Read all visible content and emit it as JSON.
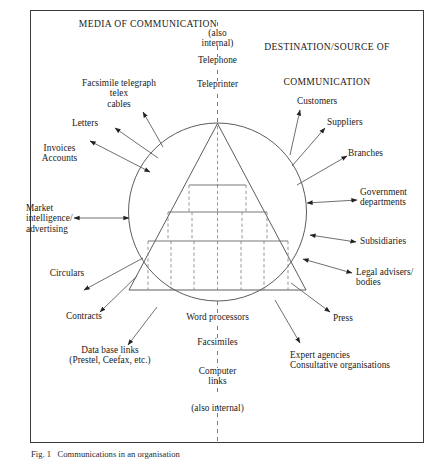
{
  "figure": {
    "caption": "Fig. 1   Communications in an organisation",
    "frame_color": "#3a3a3a",
    "line_color": "#4a4a4a",
    "text_color": "#1a1a1a"
  },
  "headings": {
    "left": "MEDIA OF COMMUNICATION",
    "right_line1": "DESTINATION/SOURCE OF",
    "right_line2": "COMMUNICATION"
  },
  "center_axis": {
    "top_items": [
      "(also\ninternal)",
      "Telephone",
      "Teleprinter"
    ],
    "bottom_items": [
      "Word processors",
      "Facsimiles",
      "Computer\nlinks",
      "(also internal)"
    ]
  },
  "media_labels": [
    {
      "text": "Facsimile telegraph\ntelex\ncables",
      "align": "center"
    },
    {
      "text": "Letters",
      "align": "center"
    },
    {
      "text": "Invoices\nAccounts",
      "align": "center"
    },
    {
      "text": "Market\nintelligence/\nadvertising",
      "align": "left"
    },
    {
      "text": "Circulars",
      "align": "center"
    },
    {
      "text": "Contracts",
      "align": "center"
    },
    {
      "text": "Data base links\n(Prestel, Ceefax, etc.)",
      "align": "center"
    }
  ],
  "destination_labels": [
    {
      "text": "Customers",
      "align": "left"
    },
    {
      "text": "Suppliers",
      "align": "left"
    },
    {
      "text": "Branches",
      "align": "left"
    },
    {
      "text": "Government\ndepartments",
      "align": "left"
    },
    {
      "text": "Subsidiaries",
      "align": "left"
    },
    {
      "text": "Legal advisers/\nbodies",
      "align": "left"
    },
    {
      "text": "Press",
      "align": "left"
    },
    {
      "text": "Expert agencies\nConsultative organisations",
      "align": "left"
    }
  ],
  "organisation": {
    "shape": "circle-with-pyramid",
    "description": "Organisation hierarchy pyramid inside a circle",
    "tier_drop_counts": [
      3,
      5,
      7
    ]
  }
}
